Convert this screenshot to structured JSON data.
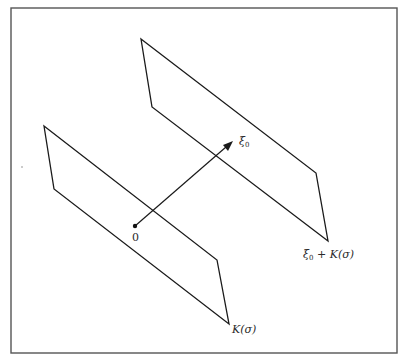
{
  "figure": {
    "frame": {
      "x1": 11,
      "y1": 8,
      "x2": 397,
      "y2": 353,
      "stroke": "#555555"
    },
    "colors": {
      "line": "#1a1a1a",
      "text": "#2a2a2a",
      "background": "#ffffff"
    }
  },
  "planes": [
    {
      "name": "K(sigma)",
      "points": "44,126 54,189 229,324 217,260",
      "label": {
        "main": "K(σ)",
        "x": 232,
        "y": 324
      }
    },
    {
      "name": "xi_0 + K(sigma)",
      "points": "141,39 152,107 328,241 316,173",
      "label": {
        "prefix": "ξ",
        "sub": "0",
        "rest": " + K(σ)",
        "x": 303,
        "y": 249
      }
    }
  ],
  "vector": {
    "from": {
      "x": 135,
      "y": 226
    },
    "to": {
      "x": 233,
      "y": 141
    },
    "origin_label": {
      "text": "0",
      "x": 132,
      "y": 232
    },
    "tip_label": {
      "prefix": "ξ",
      "sub": "0",
      "x": 239,
      "y": 136
    }
  },
  "artifacts": [
    {
      "x": 22,
      "y": 167
    }
  ]
}
